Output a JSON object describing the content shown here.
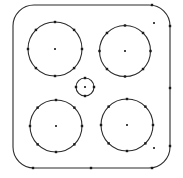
{
  "view": {
    "width": 183,
    "height": 178,
    "background_color": "#ffffff",
    "title": "Plate outline with four circular holes and center hole"
  },
  "style": {
    "outline_color": "#2b2b2b",
    "outline_width": 1.1,
    "circle_color": "#2b2b2b",
    "circle_width": 1.1,
    "node_color": "#1a1a1a",
    "node_size": 2.4,
    "center_marker_color": "#1a1a1a",
    "center_marker_size": 1.8
  },
  "outline": {
    "name": "plate-outline",
    "shape": "rounded-rectangle",
    "x": 13,
    "y": 5,
    "width": 157,
    "height": 163,
    "corner_radius": 21,
    "fill": "none"
  },
  "circles": [
    {
      "name": "hole-top-left",
      "cx": 55,
      "cy": 49,
      "r": 27,
      "node_count": 8,
      "node_start_angle": -90,
      "center_marker": true
    },
    {
      "name": "hole-top-right",
      "cx": 125,
      "cy": 51,
      "r": 25.5,
      "node_count": 8,
      "node_start_angle": -90,
      "center_marker": true
    },
    {
      "name": "hole-bottom-left",
      "cx": 56,
      "cy": 126,
      "r": 26,
      "node_count": 8,
      "node_start_angle": -90,
      "center_marker": true
    },
    {
      "name": "hole-bottom-right",
      "cx": 127,
      "cy": 125,
      "r": 26,
      "node_count": 8,
      "node_start_angle": -90,
      "center_marker": true
    },
    {
      "name": "hole-center-small",
      "cx": 85,
      "cy": 87,
      "r": 9,
      "node_count": 4,
      "node_start_angle": -90,
      "center_marker": true
    }
  ],
  "edge_nodes": [
    {
      "name": "node-top-right-edge",
      "x": 152,
      "y": 5
    },
    {
      "name": "node-right-edge-upper",
      "x": 170,
      "y": 26
    },
    {
      "name": "node-right-edge-middle",
      "x": 170,
      "y": 88
    },
    {
      "name": "node-right-edge-lower",
      "x": 170,
      "y": 146
    },
    {
      "name": "node-bottom-edge-left",
      "x": 33,
      "y": 168
    },
    {
      "name": "node-bottom-edge-center",
      "x": 91,
      "y": 168
    },
    {
      "name": "node-bottom-edge-right",
      "x": 152,
      "y": 168
    }
  ],
  "free_points": [
    {
      "name": "point-upper-right-inner",
      "x": 154,
      "y": 23
    },
    {
      "name": "point-lower-right-inner",
      "x": 154,
      "y": 148
    }
  ]
}
